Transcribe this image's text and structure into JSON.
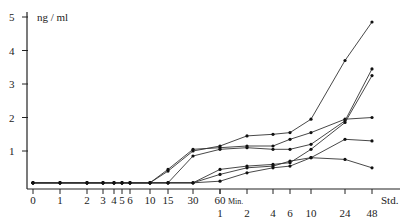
{
  "chart_data": {
    "type": "line",
    "title": "",
    "ylabel": "ng / ml",
    "xlabel": "",
    "ylim": [
      0,
      5
    ],
    "yticks": [
      "1",
      "2",
      "3",
      "4",
      "5"
    ],
    "x_units": {
      "minutes_label": "Min.",
      "hours_label": "Std."
    },
    "x_min_ticks": [
      "0",
      "1",
      "2",
      "3",
      "4",
      "5",
      "6",
      "10",
      "15",
      "30",
      "60"
    ],
    "x_hour_ticks": [
      "1",
      "2",
      "4",
      "6",
      "10",
      "24",
      "48"
    ],
    "x": [
      "0 min",
      "1 min",
      "2 min",
      "3 min",
      "4 min",
      "5 min",
      "6 min",
      "10 min",
      "15 min",
      "30 min",
      "60 min / 1 Std.",
      "2 Std.",
      "4 Std.",
      "6 Std.",
      "10 Std.",
      "24 Std.",
      "48 Std."
    ],
    "grid": false,
    "legend": null,
    "series": [
      {
        "name": "Curve 1",
        "values": [
          0.05,
          0.05,
          0.05,
          0.05,
          0.05,
          0.05,
          0.05,
          0.05,
          0.4,
          1.0,
          1.15,
          1.45,
          1.5,
          1.55,
          1.95,
          3.7,
          4.85
        ]
      },
      {
        "name": "Curve 2",
        "values": [
          0.05,
          0.05,
          0.05,
          0.05,
          0.05,
          0.05,
          0.05,
          0.05,
          0.45,
          1.05,
          1.1,
          1.15,
          1.15,
          1.35,
          1.55,
          1.95,
          2.0
        ]
      },
      {
        "name": "Curve 3",
        "values": [
          0.05,
          0.05,
          0.05,
          0.05,
          0.05,
          0.05,
          0.05,
          0.05,
          0.05,
          0.85,
          1.05,
          1.1,
          1.05,
          1.05,
          1.2,
          1.9,
          3.45
        ]
      },
      {
        "name": "Curve 4",
        "values": [
          0.05,
          0.05,
          0.05,
          0.05,
          0.05,
          0.05,
          0.05,
          0.05,
          0.05,
          0.05,
          0.45,
          0.55,
          0.6,
          0.65,
          1.05,
          1.85,
          3.25
        ]
      },
      {
        "name": "Curve 5",
        "values": [
          0.05,
          0.05,
          0.05,
          0.05,
          0.05,
          0.05,
          0.05,
          0.05,
          0.05,
          0.05,
          0.3,
          0.5,
          0.55,
          0.7,
          0.8,
          1.35,
          1.3
        ]
      },
      {
        "name": "Curve 6",
        "values": [
          0.05,
          0.05,
          0.05,
          0.05,
          0.05,
          0.05,
          0.05,
          0.05,
          0.05,
          0.05,
          0.1,
          0.35,
          0.5,
          0.55,
          0.8,
          0.75,
          0.5
        ]
      }
    ]
  }
}
